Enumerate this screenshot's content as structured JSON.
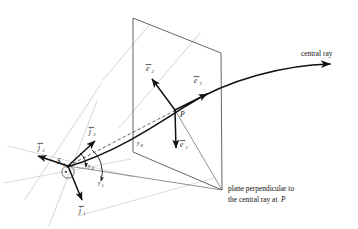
{
  "figure": {
    "type": "geometric-diagram",
    "background": "#ffffff",
    "ink_color": "#111111",
    "guide_color": "#d8d8d8"
  },
  "labels": {
    "central_ray": "central ray",
    "caption_line1": "plane perpendicular to",
    "caption_line2a": "the central ray at",
    "caption_line2b": "P",
    "point_P": "P",
    "point_S": "S",
    "point_S_sub": "0",
    "e1": "e",
    "e1_sub": "1",
    "e2": "e",
    "e2_sub": "2",
    "e3": "e",
    "e3_sub": "3",
    "j1": "j",
    "j1_sub": "1",
    "j2": "j",
    "j2_sub": "2",
    "j3": "j",
    "j3_sub": "3",
    "y0": "y",
    "y0_sub": "0",
    "y1": "y",
    "y1_sub": "1",
    "y2": "y",
    "y2_sub": "2"
  },
  "geometry": {
    "plane_polygon": "133,18 221,53 222,190 133,152",
    "ray_path": "M 68,166 C 120,150 180,112 240,88 C 280,72 315,66 340,65",
    "ray_arrow_tip": "340,65",
    "source_point": {
      "x": 68,
      "y": 166
    },
    "plane_point_P": {
      "x": 175,
      "y": 110
    },
    "vectors": [
      {
        "name": "e2",
        "from": "175,110",
        "to": "150,77"
      },
      {
        "name": "e3",
        "from": "175,110",
        "to": "209,93"
      },
      {
        "name": "e1",
        "from": "175,110",
        "to": "176,152"
      },
      {
        "name": "j3",
        "from": "68,166",
        "to": "97,139"
      },
      {
        "name": "j2",
        "from": "68,166",
        "to": "35,155"
      },
      {
        "name": "j1",
        "from": "68,166",
        "to": "83,204"
      }
    ],
    "dashed_lines": [
      "M 68,166 L 175,110",
      "M 209,93 L 219,89"
    ],
    "thin_lines": [
      "M 68,166 L 222,190",
      "M 175,110 L 222,190"
    ],
    "guide_lines": [
      "M 25,196 L 100,86",
      "M 10,147 L 130,176",
      "M 48,224 L 96,104",
      "M 6,182 L 128,160",
      "M 118,126 L 198,36",
      "M 80,214 L 212,176"
    ],
    "angle_arcs": [
      {
        "name": "y0-arc",
        "cx": 68,
        "cy": 166,
        "r": 18,
        "a1": -48,
        "a2": 3
      },
      {
        "name": "y1-arc",
        "cx": 68,
        "cy": 166,
        "r": 29,
        "a1": -30,
        "a2": 14
      }
    ]
  }
}
